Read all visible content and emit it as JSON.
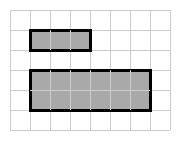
{
  "figure": {
    "title": "",
    "background_color": "#ffffff",
    "width": 188,
    "height": 143
  },
  "grid": {
    "name": "square-grid",
    "origin_x": 10,
    "origin_y": 10,
    "cell_size": 20,
    "columns": 8,
    "rows": 6,
    "line_color": "#cccccc",
    "line_width": 1,
    "total_width": 160,
    "total_height": 120
  },
  "chart_data": {
    "type": "table",
    "xlabel": "",
    "ylabel": "",
    "grid": true,
    "legend_position": "none",
    "units": "grid squares",
    "grid_columns": 8,
    "grid_rows": 6,
    "categories": [
      "small rectangle",
      "large rectangle"
    ],
    "values": [
      3,
      12
    ],
    "annotations": [],
    "shapes": [
      {
        "id": "small-rectangle",
        "label": "small rectangle",
        "col_start": 1,
        "row_start": 1,
        "cols_wide": 3,
        "rows_tall": 1,
        "x": 30,
        "y": 30,
        "width": 60,
        "height": 20,
        "area_cells": 3,
        "perimeter_cells": 8,
        "fill_color": "#a9a9a9",
        "stroke_color": "#000000",
        "stroke_width": 3
      },
      {
        "id": "large-rectangle",
        "label": "large rectangle",
        "col_start": 1,
        "row_start": 3,
        "cols_wide": 6,
        "rows_tall": 2,
        "x": 30,
        "y": 70,
        "width": 120,
        "height": 40,
        "area_cells": 12,
        "perimeter_cells": 16,
        "fill_color": "#a9a9a9",
        "stroke_color": "#000000",
        "stroke_width": 3
      }
    ]
  }
}
